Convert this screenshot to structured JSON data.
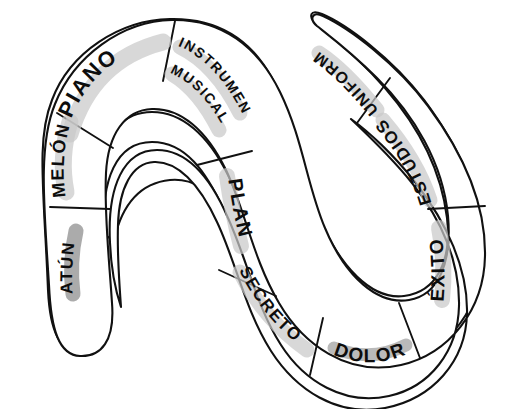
{
  "document": {
    "title": "Serpiente de palabras",
    "type": "hand-drawn serpentine word track",
    "background_color": "#ffffff",
    "ink_color": "#111111",
    "highlight_color_light": "#c9c9c9",
    "highlight_color_dark": "#8a8a8a",
    "segment_count": 9
  },
  "segments": [
    {
      "index": 1,
      "label": "ATÚN",
      "position": "lower-left tail cap",
      "orientation": "rotated, reading upward along the left tail",
      "highlight": "dark",
      "highlight_color": "#8a8a8a"
    },
    {
      "index": 2,
      "label": "MELÓN",
      "position": "left outer band",
      "orientation": "rotated, reading upward along the left outer curve",
      "highlight": "light",
      "highlight_color": "#c9c9c9"
    },
    {
      "index": 3,
      "label": "PIANO",
      "position": "top-left arch",
      "orientation": "arched along the top-left curve",
      "highlight": "light",
      "highlight_color": "#c9c9c9"
    },
    {
      "index": 4,
      "label": "INSTRUMENTO MUSICAL",
      "line_1": "INSTRUMENTO",
      "line_2": "MUSICAL",
      "position": "top-middle descending band",
      "orientation": "two lines angled down-right",
      "highlight": "light",
      "highlight_color": "#c9c9c9"
    },
    {
      "index": 5,
      "label": "PLAN",
      "position": "middle vertical band",
      "orientation": "rotated, reading downward",
      "highlight": "light",
      "highlight_color": "#c9c9c9"
    },
    {
      "index": 6,
      "label": "SECRETO",
      "position": "lower-middle curve",
      "orientation": "arched down-right along the bottom curve",
      "highlight": "light",
      "highlight_color": "#c9c9c9"
    },
    {
      "index": 7,
      "label": "DOLOR",
      "position": "bottom-right curve",
      "orientation": "arched along the bottom of the right loop",
      "highlight": "light",
      "highlight_color": "#c9c9c9"
    },
    {
      "index": 8,
      "label": "ÉXITO",
      "position": "right outer band",
      "orientation": "upside-down, reading upward on the right side",
      "highlight": "light",
      "highlight_color": "#c9c9c9"
    },
    {
      "index": 9,
      "label": "ESTUDIOS",
      "position": "upper-right band",
      "orientation": "upside-down along the upper-right curve",
      "highlight": "light",
      "highlight_color": "#c9c9c9"
    },
    {
      "index": 10,
      "label": "UNIFORME",
      "position": "top-right head cap",
      "orientation": "upside-down along the top-right cap",
      "highlight": "light",
      "highlight_color": "#c9c9c9"
    }
  ]
}
